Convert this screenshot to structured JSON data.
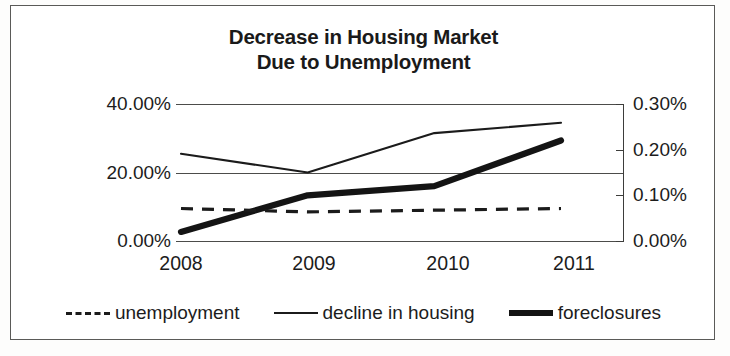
{
  "chart_data": {
    "type": "line",
    "title": "Decrease in Housing Market Due to Unemployment",
    "title_line1": "Decrease in Housing Market",
    "title_line2": "Due to Unemployment",
    "categories": [
      "2008",
      "2009",
      "2010",
      "2011"
    ],
    "xlabel": "",
    "ylabel": "",
    "grid": true,
    "legend_position": "bottom",
    "axes": {
      "left": {
        "ticks": [
          "0.00%",
          "20.00%",
          "40.00%"
        ],
        "tick_values": [
          0,
          20,
          40
        ],
        "ylim": [
          0,
          40
        ],
        "gridlines": true
      },
      "right": {
        "ticks": [
          "0.00%",
          "0.10%",
          "0.20%",
          "0.30%"
        ],
        "tick_values": [
          0,
          0.1,
          0.2,
          0.3
        ],
        "ylim": [
          0,
          0.3
        ],
        "gridlines": false
      }
    },
    "series": [
      {
        "name": "unemployment",
        "axis": "left",
        "style": "dashed",
        "values": [
          9.5,
          8.5,
          9.0,
          9.5
        ]
      },
      {
        "name": "decline in housing",
        "axis": "left",
        "style": "thin-solid",
        "values": [
          25.5,
          20.0,
          31.5,
          34.5
        ]
      },
      {
        "name": "foreclosures",
        "axis": "right",
        "style": "thick-solid",
        "values": [
          0.02,
          0.1,
          0.12,
          0.22
        ]
      }
    ]
  },
  "legend": {
    "items": [
      {
        "label": "unemployment",
        "style": "dashed"
      },
      {
        "label": "decline in housing",
        "style": "thin"
      },
      {
        "label": "foreclosures",
        "style": "thick"
      }
    ]
  },
  "colors": {
    "line": "#1b1b1b",
    "grid": "#4c4c4a",
    "frame": "#5a5a58",
    "text": "#1c1c1c",
    "background": "#ffffff"
  }
}
